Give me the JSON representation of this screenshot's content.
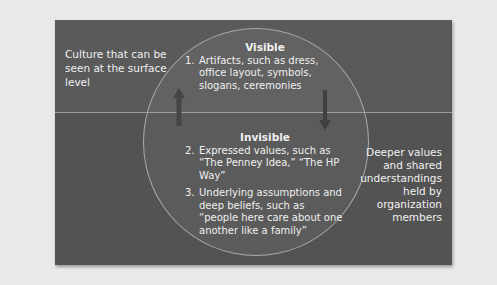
{
  "diagram": {
    "left_label": "Culture that can be seen at the surface level",
    "right_label": "Deeper values and shared understandings held by organization members",
    "visible": {
      "heading": "Visible",
      "items": [
        {
          "num": "1.",
          "text": "Artifacts, such as dress, office layout, symbols, slogans, ceremonies"
        }
      ]
    },
    "invisible": {
      "heading": "Invisible",
      "items": [
        {
          "num": "2.",
          "text": "Expressed values, such as “The Penney Idea,” “The HP Way”"
        },
        {
          "num": "3.",
          "text": "Underlying assumptions and deep beliefs, such as “people here care about one another like a family”"
        }
      ]
    },
    "arrows": [
      {
        "direction": "up",
        "icon": "arrow-up-icon"
      },
      {
        "direction": "down",
        "icon": "arrow-down-icon"
      }
    ],
    "colors": {
      "page_bg": "#e9e9e9",
      "upper_bg": "#5a5a5a",
      "lower_bg": "#535353",
      "text": "#f0f0f0",
      "circle_stroke": "#a8a8a8"
    }
  }
}
